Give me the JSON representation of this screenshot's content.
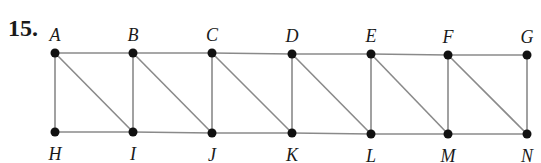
{
  "problem_number": "15.",
  "colors": {
    "edge": "#8a8a8a",
    "node": "#111111",
    "text": "#1a1a1a"
  },
  "graph": {
    "vertices": [
      {
        "id": "A",
        "label": "A",
        "x": 55,
        "y": 53,
        "label_pos": "top"
      },
      {
        "id": "B",
        "label": "B",
        "x": 133,
        "y": 53,
        "label_pos": "top"
      },
      {
        "id": "C",
        "label": "C",
        "x": 212,
        "y": 53,
        "label_pos": "top"
      },
      {
        "id": "D",
        "label": "D",
        "x": 292,
        "y": 54,
        "label_pos": "top"
      },
      {
        "id": "E",
        "label": "E",
        "x": 371,
        "y": 54,
        "label_pos": "top"
      },
      {
        "id": "F",
        "label": "F",
        "x": 448,
        "y": 55,
        "label_pos": "top"
      },
      {
        "id": "G",
        "label": "G",
        "x": 527,
        "y": 55,
        "label_pos": "top"
      },
      {
        "id": "H",
        "label": "H",
        "x": 55,
        "y": 132,
        "label_pos": "bottom"
      },
      {
        "id": "I",
        "label": "I",
        "x": 133,
        "y": 132,
        "label_pos": "bottom"
      },
      {
        "id": "J",
        "label": "J",
        "x": 212,
        "y": 133,
        "label_pos": "bottom"
      },
      {
        "id": "K",
        "label": "K",
        "x": 292,
        "y": 133,
        "label_pos": "bottom"
      },
      {
        "id": "L",
        "label": "L",
        "x": 371,
        "y": 134,
        "label_pos": "bottom"
      },
      {
        "id": "M",
        "label": "M",
        "x": 448,
        "y": 134,
        "label_pos": "bottom"
      },
      {
        "id": "N",
        "label": "N",
        "x": 527,
        "y": 134,
        "label_pos": "bottom"
      }
    ],
    "edges": [
      [
        "A",
        "B"
      ],
      [
        "B",
        "C"
      ],
      [
        "C",
        "D"
      ],
      [
        "D",
        "E"
      ],
      [
        "E",
        "F"
      ],
      [
        "F",
        "G"
      ],
      [
        "H",
        "I"
      ],
      [
        "I",
        "J"
      ],
      [
        "J",
        "K"
      ],
      [
        "K",
        "L"
      ],
      [
        "L",
        "M"
      ],
      [
        "M",
        "N"
      ],
      [
        "A",
        "H"
      ],
      [
        "B",
        "I"
      ],
      [
        "C",
        "J"
      ],
      [
        "D",
        "K"
      ],
      [
        "E",
        "L"
      ],
      [
        "F",
        "M"
      ],
      [
        "G",
        "N"
      ],
      [
        "A",
        "I"
      ],
      [
        "B",
        "J"
      ],
      [
        "C",
        "K"
      ],
      [
        "D",
        "L"
      ],
      [
        "E",
        "M"
      ],
      [
        "F",
        "N"
      ]
    ]
  }
}
